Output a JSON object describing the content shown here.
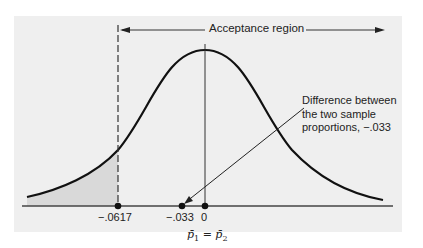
{
  "figure": {
    "type": "hypothesis-test-diagram",
    "acceptance_label": "Acceptance region",
    "annotation": {
      "line1": "Difference between",
      "line2": "the two sample",
      "line3": "proportions, −.033"
    },
    "ticks": [
      {
        "label": "−.0617",
        "value": -0.0617
      },
      {
        "label": "−.033",
        "value": -0.033
      },
      {
        "label": "0",
        "value": 0
      }
    ],
    "null_hypothesis_label": {
      "p1": "p̄",
      "sub1": "1",
      "eq": " = ",
      "p2": "p̄",
      "sub2": "2"
    },
    "colors": {
      "background": "#efefef",
      "curve": "#111111",
      "shaded_tail": "#d9d9d9"
    }
  }
}
